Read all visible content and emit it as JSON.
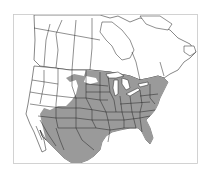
{
  "figure": {
    "type": "species-range-map",
    "region": "North America",
    "title": "",
    "frame_color": "#c8c8c8",
    "background_color": "#ffffff",
    "land_color": "#ffffff",
    "boundary_color": "#222222",
    "range_color": "#9a9a9a",
    "range_description": "Shaded range covering the eastern and central United States west to the Great Plains, the southwestern US, and northern Mexico; absent from the Pacific Northwest, northern Rockies, and Canada",
    "legend": []
  }
}
